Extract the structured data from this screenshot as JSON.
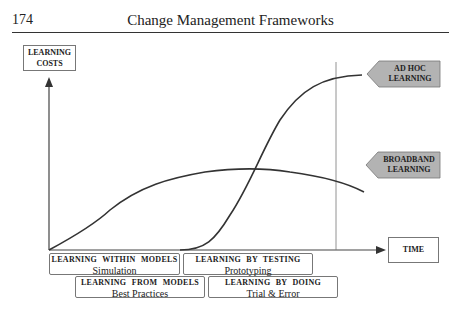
{
  "header": {
    "page_number": "174",
    "running_title": "Change Management Frameworks"
  },
  "axes": {
    "y_label_line1": "LEARNING",
    "y_label_line2": "COSTS",
    "x_label": "TIME"
  },
  "curve_labels": {
    "ad_hoc_line1": "AD HOC",
    "ad_hoc_line2": "LEARNING",
    "broadband_line1": "BROADBAND",
    "broadband_line2": "LEARNING"
  },
  "phases": [
    {
      "title": "LEARNING WITHIN MODELS",
      "subtitle": "Simulation"
    },
    {
      "title": "LEARNING BY TESTING",
      "subtitle": "Prototyping"
    },
    {
      "title": "LEARNING FROM MODELS",
      "subtitle": "Best Practices"
    },
    {
      "title": "LEARNING BY DOING",
      "subtitle": "Trial & Error"
    }
  ],
  "colors": {
    "tag_fill": "#b3b3b3",
    "line": "#333333"
  }
}
